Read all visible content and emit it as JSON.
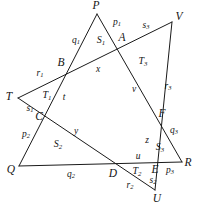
{
  "figure": {
    "type": "geometry-diagram",
    "width": 199,
    "height": 213,
    "stroke_color": "#1a1a1a",
    "background": "#ffffff",
    "points": {
      "P": {
        "label": "P",
        "x": 97,
        "y": 14,
        "label_x": 96,
        "label_y": 6
      },
      "Q": {
        "label": "Q",
        "x": 19,
        "y": 166,
        "label_x": 11,
        "label_y": 170
      },
      "R": {
        "label": "R",
        "x": 182,
        "y": 162,
        "label_x": 188,
        "label_y": 163
      },
      "T": {
        "label": "T",
        "x": 18,
        "y": 98,
        "label_x": 9,
        "label_y": 97
      },
      "U": {
        "label": "U",
        "x": 155,
        "y": 190,
        "label_x": 157,
        "label_y": 199
      },
      "V": {
        "label": "V",
        "x": 172,
        "y": 22,
        "label_x": 179,
        "label_y": 17
      },
      "A": {
        "label": "A",
        "x": 124,
        "y": 40,
        "label_x": 122,
        "label_y": 38
      },
      "B": {
        "label": "B",
        "x": 65,
        "y": 70,
        "label_x": 61,
        "label_y": 63
      },
      "C": {
        "label": "C",
        "x": 43,
        "y": 117,
        "label_x": 39,
        "label_y": 117
      },
      "D": {
        "label": "D",
        "x": 115,
        "y": 166,
        "label_x": 113,
        "label_y": 174
      },
      "E": {
        "label": "E",
        "x": 157,
        "y": 166,
        "label_x": 155,
        "label_y": 170
      },
      "F": {
        "label": "F",
        "x": 157,
        "y": 113,
        "label_x": 162,
        "label_y": 114
      }
    },
    "lines": [
      {
        "name": "line-P-Q",
        "from": "P",
        "to": "Q"
      },
      {
        "name": "line-Q-R",
        "from": "Q",
        "to": "R"
      },
      {
        "name": "line-P-R",
        "from": "P",
        "to": "R"
      },
      {
        "name": "line-T-V",
        "from": "T",
        "to": "V"
      },
      {
        "name": "line-T-U",
        "from": "T",
        "to": "U"
      },
      {
        "name": "line-V-U",
        "from": "V",
        "to": "U"
      }
    ],
    "segment_labels": [
      {
        "name": "segment-label-p1",
        "base": "p",
        "sub": "1",
        "x": 117,
        "y": 23
      },
      {
        "name": "segment-label-q1",
        "base": "q",
        "sub": "1",
        "x": 76,
        "y": 41
      },
      {
        "name": "segment-label-r1",
        "base": "r",
        "sub": "1",
        "x": 40,
        "y": 74
      },
      {
        "name": "segment-label-s1",
        "base": "s",
        "sub": "1",
        "x": 30,
        "y": 109
      },
      {
        "name": "segment-label-p2",
        "base": "p",
        "sub": "2",
        "x": 26,
        "y": 135
      },
      {
        "name": "segment-label-q2",
        "base": "q",
        "sub": "2",
        "x": 71,
        "y": 175
      },
      {
        "name": "segment-label-r2",
        "base": "r",
        "sub": "2",
        "x": 130,
        "y": 186
      },
      {
        "name": "segment-label-s2",
        "base": "s",
        "sub": "2",
        "x": 153,
        "y": 181
      },
      {
        "name": "segment-label-p3",
        "base": "p",
        "sub": "3",
        "x": 170,
        "y": 171
      },
      {
        "name": "segment-label-q3",
        "base": "q",
        "sub": "3",
        "x": 174,
        "y": 131
      },
      {
        "name": "segment-label-r3",
        "base": "r",
        "sub": "3",
        "x": 168,
        "y": 87
      },
      {
        "name": "segment-label-s3",
        "base": "s",
        "sub": "3",
        "x": 146,
        "y": 26
      },
      {
        "name": "segment-label-t",
        "base": "t",
        "sub": "",
        "x": 64,
        "y": 98
      },
      {
        "name": "segment-label-u",
        "base": "u",
        "sub": "",
        "x": 138,
        "y": 157
      },
      {
        "name": "segment-label-v",
        "base": "v",
        "sub": "",
        "x": 134,
        "y": 90
      },
      {
        "name": "segment-label-x",
        "base": "x",
        "sub": "",
        "x": 98,
        "y": 70
      },
      {
        "name": "segment-label-y",
        "base": "y",
        "sub": "",
        "x": 76,
        "y": 132
      },
      {
        "name": "segment-label-z",
        "base": "z",
        "sub": "",
        "x": 147,
        "y": 141
      }
    ],
    "region_labels": [
      {
        "name": "region-label-S1",
        "base": "S",
        "sub": "1",
        "x": 101,
        "y": 41
      },
      {
        "name": "region-label-S2",
        "base": "S",
        "sub": "2",
        "x": 58,
        "y": 145
      },
      {
        "name": "region-label-S3",
        "base": "S",
        "sub": "3",
        "x": 160,
        "y": 148
      },
      {
        "name": "region-label-T1",
        "base": "T",
        "sub": "1",
        "x": 47,
        "y": 96
      },
      {
        "name": "region-label-T2",
        "base": "T",
        "sub": "2",
        "x": 137,
        "y": 172
      },
      {
        "name": "region-label-T3",
        "base": "T",
        "sub": "3",
        "x": 143,
        "y": 62
      }
    ]
  }
}
